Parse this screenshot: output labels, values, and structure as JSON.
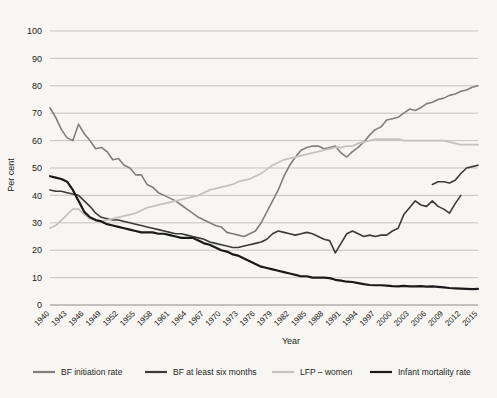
{
  "chart_data": {
    "type": "line",
    "title": "",
    "xlabel": "Year",
    "ylabel": "Per cent",
    "xlim": [
      1940,
      2015
    ],
    "ylim": [
      0,
      100
    ],
    "yticks": [
      0,
      10,
      20,
      30,
      40,
      50,
      60,
      70,
      80,
      90,
      100
    ],
    "grid": true,
    "legend_position": "bottom",
    "categories": [
      1940,
      1941,
      1942,
      1943,
      1944,
      1945,
      1946,
      1947,
      1948,
      1949,
      1950,
      1951,
      1952,
      1953,
      1954,
      1955,
      1956,
      1957,
      1958,
      1959,
      1960,
      1961,
      1962,
      1963,
      1964,
      1965,
      1966,
      1967,
      1968,
      1969,
      1970,
      1971,
      1972,
      1973,
      1974,
      1975,
      1976,
      1977,
      1978,
      1979,
      1980,
      1981,
      1982,
      1983,
      1984,
      1985,
      1986,
      1987,
      1988,
      1989,
      1990,
      1991,
      1992,
      1993,
      1994,
      1995,
      1996,
      1997,
      1998,
      1999,
      2000,
      2001,
      2002,
      2003,
      2004,
      2005,
      2006,
      2007,
      2008,
      2009,
      2010,
      2011,
      2012,
      2013,
      2014,
      2015
    ],
    "xticklabels": [
      "1940",
      "1943",
      "1946",
      "1949",
      "1952",
      "1955",
      "1958",
      "1961",
      "1964",
      "1967",
      "1970",
      "1973",
      "1976",
      "1979",
      "1982",
      "1985",
      "1988",
      "1991",
      "1994",
      "1997",
      "2000",
      "2003",
      "2006",
      "2009",
      "2012",
      "2015"
    ],
    "series": [
      {
        "name": "BF initiation rate",
        "color": "#7f7f7c",
        "width": 1.6,
        "values": [
          72,
          68.5,
          64,
          61,
          60,
          66,
          62.5,
          60,
          57,
          57.5,
          56,
          53,
          53.5,
          51,
          50,
          47.5,
          47.5,
          44,
          43,
          41,
          40,
          39,
          38,
          36.5,
          35,
          33.5,
          32,
          31,
          30,
          29,
          28.5,
          26.5,
          26,
          25.5,
          25,
          26,
          27,
          30,
          34,
          38,
          42,
          47,
          51,
          54,
          56.5,
          57.5,
          58,
          58,
          57,
          57.5,
          58,
          55.5,
          54,
          56,
          57.5,
          59.5,
          62,
          64,
          65,
          67.5,
          68,
          68.5,
          70,
          71.5,
          71,
          72,
          73.5,
          74,
          75,
          75.5,
          76.5,
          77,
          78,
          78.5,
          79.5,
          80
        ]
      },
      {
        "name": "BF at least six months",
        "color": "#3b3b3b",
        "width": 1.6,
        "values": [
          42,
          41.5,
          41.5,
          41,
          40.5,
          40,
          38,
          36,
          33.5,
          32,
          31.5,
          31,
          31,
          30.5,
          30,
          29.5,
          29,
          28.5,
          28,
          27.5,
          27,
          26.5,
          26,
          26,
          25.5,
          25,
          24.5,
          24,
          23,
          22.5,
          22,
          21.5,
          21,
          21,
          21.5,
          22,
          22.5,
          23,
          24,
          26,
          27,
          26.5,
          26,
          25.5,
          26,
          26.5,
          26,
          25,
          24,
          23.5,
          19,
          22.5,
          26,
          27,
          26,
          25,
          25.5,
          25,
          25.5,
          25.5,
          27,
          28,
          33,
          35.5,
          38,
          36.5,
          36,
          38,
          36,
          35,
          33.5,
          37,
          40,
          null,
          null,
          null
        ]
      },
      {
        "name": "BF at least six months (continued)",
        "color": "#3b3b3b",
        "width": 1.6,
        "values": [
          null,
          null,
          null,
          null,
          null,
          null,
          null,
          null,
          null,
          null,
          null,
          null,
          null,
          null,
          null,
          null,
          null,
          null,
          null,
          null,
          null,
          null,
          null,
          null,
          null,
          null,
          null,
          null,
          null,
          null,
          null,
          null,
          null,
          null,
          null,
          null,
          null,
          null,
          null,
          null,
          null,
          null,
          null,
          null,
          null,
          null,
          null,
          null,
          null,
          null,
          null,
          null,
          null,
          null,
          null,
          null,
          null,
          null,
          null,
          null,
          null,
          null,
          null,
          null,
          null,
          null,
          null,
          44,
          45,
          45,
          44.5,
          45.5,
          48,
          50,
          50.5,
          51
        ]
      },
      {
        "name": "LFP – women",
        "color": "#c4c3c0",
        "width": 1.8,
        "values": [
          28,
          29,
          31,
          33,
          35,
          35,
          33,
          31.5,
          31,
          30.5,
          31,
          31.5,
          32,
          32.5,
          33,
          33.5,
          34.5,
          35.5,
          36,
          36.5,
          37,
          37.5,
          38,
          38.5,
          39,
          39.5,
          40,
          41,
          42,
          42.5,
          43,
          43.5,
          44,
          45,
          45.5,
          46,
          47,
          48,
          49.5,
          51,
          52,
          53,
          53.5,
          54,
          54.5,
          55,
          55.5,
          56,
          56.5,
          57,
          57.5,
          57.5,
          58,
          58,
          59,
          59.5,
          60,
          60.5,
          60.5,
          60.5,
          60.5,
          60.5,
          60,
          60,
          60,
          60,
          60,
          60,
          60,
          60,
          59.5,
          59,
          58.5,
          58.5,
          58.5,
          58.5
        ]
      },
      {
        "name": "Infant mortality rate",
        "color": "#1a1a1a",
        "width": 2.2,
        "values": [
          47,
          46.5,
          46,
          45,
          42,
          38,
          34,
          32,
          31,
          30.5,
          29.5,
          29,
          28.5,
          28,
          27.5,
          27,
          26.5,
          26.5,
          26.5,
          26,
          26,
          25.5,
          25,
          24.5,
          24.5,
          24.5,
          23.5,
          22.5,
          22,
          21,
          20,
          19.5,
          18.5,
          18,
          17,
          16,
          15,
          14,
          13.5,
          13,
          12.5,
          12,
          11.5,
          11,
          10.5,
          10.5,
          10,
          10,
          10,
          9.8,
          9.2,
          8.9,
          8.5,
          8.4,
          8,
          7.6,
          7.3,
          7.2,
          7.2,
          7.1,
          6.9,
          6.8,
          7,
          6.8,
          6.8,
          6.9,
          6.7,
          6.8,
          6.6,
          6.4,
          6.2,
          6.1,
          6,
          5.9,
          5.8,
          5.9
        ]
      }
    ]
  },
  "legend": {
    "items": [
      {
        "label": "BF initiation rate",
        "color": "#7f7f7c"
      },
      {
        "label": "BF at least six months",
        "color": "#3b3b3b"
      },
      {
        "label": "LFP – women",
        "color": "#c4c3c0"
      },
      {
        "label": "Infant mortality rate",
        "color": "#1a1a1a"
      }
    ]
  }
}
